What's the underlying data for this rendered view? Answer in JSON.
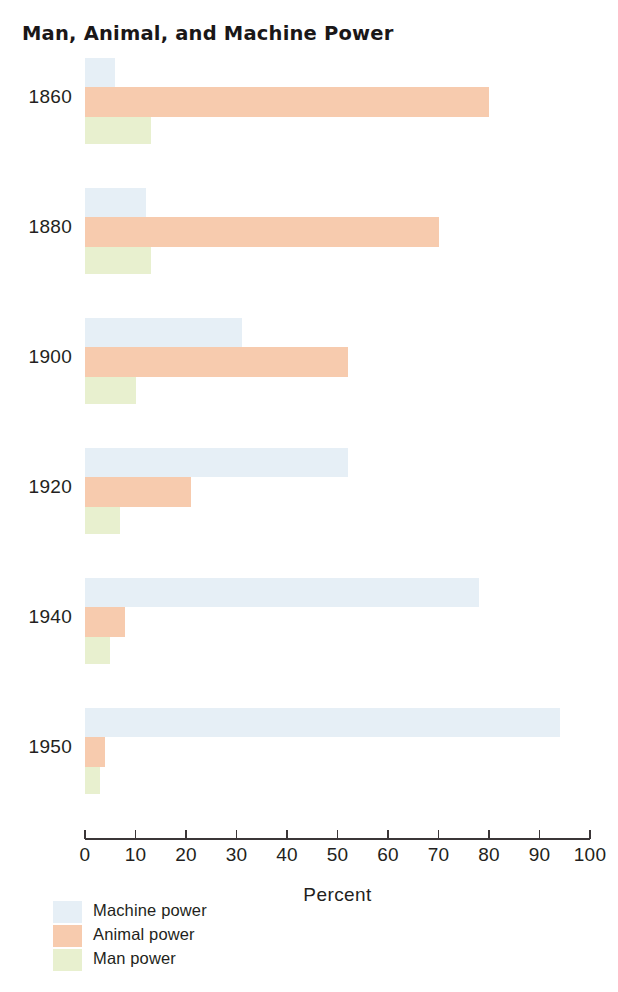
{
  "title": "Man, Animal, and Machine Power",
  "axis": {
    "title": "Percent",
    "ticks": [
      "0",
      "10",
      "20",
      "30",
      "40",
      "50",
      "60",
      "70",
      "80",
      "90",
      "100"
    ]
  },
  "legend": {
    "items": [
      {
        "label": "Machine power",
        "color": "#e6eff6"
      },
      {
        "label": "Animal power",
        "color": "#f7cbae"
      },
      {
        "label": "Man power",
        "color": "#e8f0cf"
      }
    ]
  },
  "years": [
    "1860",
    "1880",
    "1900",
    "1920",
    "1940",
    "1950"
  ],
  "colors": {
    "machine": "#e6eff6",
    "animal": "#f7cbae",
    "man": "#e8f0cf",
    "axis": "#3b3638",
    "text": "#231f20"
  },
  "chart_data": {
    "type": "bar",
    "orientation": "horizontal",
    "title": "Man, Animal, and Machine Power",
    "xlabel": "Percent",
    "ylabel": "",
    "xlim": [
      0,
      100
    ],
    "grid": false,
    "legend_position": "bottom-left",
    "categories": [
      "1860",
      "1880",
      "1900",
      "1920",
      "1940",
      "1950"
    ],
    "series": [
      {
        "name": "Machine power",
        "color": "#e6eff6",
        "values": [
          6,
          12,
          31,
          52,
          78,
          94
        ]
      },
      {
        "name": "Animal power",
        "color": "#f7cbae",
        "values": [
          80,
          70,
          52,
          21,
          8,
          4
        ]
      },
      {
        "name": "Man power",
        "color": "#e8f0cf",
        "values": [
          13,
          13,
          10,
          7,
          5,
          3
        ]
      }
    ]
  }
}
